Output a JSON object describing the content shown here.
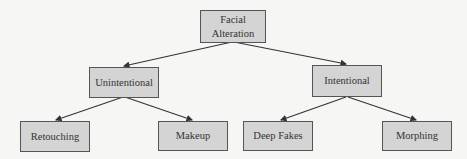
{
  "diagram": {
    "type": "tree",
    "colors": {
      "node_fill": "#d4d4d4",
      "node_border": "#555555",
      "edge": "#333333",
      "background": "#f6f6f4"
    },
    "root": {
      "id": "root",
      "label": "Facial Alteration",
      "line1": "Facial",
      "line2": "Alteration"
    },
    "level1": [
      {
        "id": "unintentional",
        "label": "Unintentional",
        "parent": "root"
      },
      {
        "id": "intentional",
        "label": "Intentional",
        "parent": "root"
      }
    ],
    "level2": [
      {
        "id": "retouching",
        "label": "Retouching",
        "parent": "unintentional"
      },
      {
        "id": "makeup",
        "label": "Makeup",
        "parent": "unintentional"
      },
      {
        "id": "deepfakes",
        "label": "Deep Fakes",
        "parent": "intentional"
      },
      {
        "id": "morphing",
        "label": "Morphing",
        "parent": "intentional"
      }
    ]
  }
}
